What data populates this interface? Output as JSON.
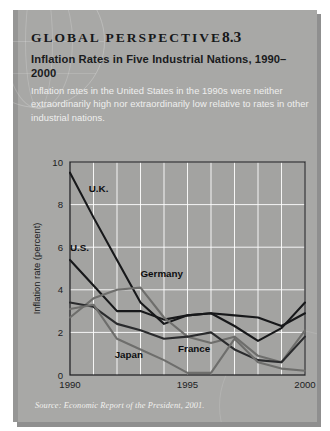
{
  "panel": {
    "kicker_text": "GLOBAL PERSPECTIVE",
    "kicker_number": "8.3",
    "headline": "Inflation Rates in Five Industrial Nations, 1990–2000",
    "lede": "Inflation rates in the United States in the 1990s were neither extraordinarily high nor extraordinarily low relative to rates in other industrial nations.",
    "source": "Source: Economic Report of the President, 2001.",
    "background_color": "#a8a8a6",
    "page_color": "#ffffff"
  },
  "chart_data": {
    "type": "line",
    "xlabel": "",
    "ylabel": "Inflation rate (percent)",
    "x": [
      1990,
      1991,
      1992,
      1993,
      1994,
      1995,
      1996,
      1997,
      1998,
      1999,
      2000
    ],
    "xlim": [
      1990,
      2000
    ],
    "ylim": [
      0,
      10
    ],
    "xticks": [
      1990,
      1995,
      2000
    ],
    "xticklabels": [
      "1990",
      "1995",
      "2000"
    ],
    "yticks": [
      0,
      2,
      4,
      6,
      8,
      10
    ],
    "yticklabels": [
      "0",
      "2",
      "4",
      "6",
      "8",
      "10"
    ],
    "grid": true,
    "grid_color": "#ffffff",
    "legend": "inline-labels",
    "series": [
      {
        "name": "U.K.",
        "color": "#17181a",
        "values": [
          9.5,
          7.4,
          5.4,
          3.4,
          2.4,
          2.8,
          2.9,
          2.8,
          2.7,
          2.3,
          2.9
        ]
      },
      {
        "name": "U.S.",
        "color": "#17181a",
        "values": [
          5.4,
          4.2,
          3.0,
          3.0,
          2.6,
          2.8,
          2.9,
          2.3,
          1.6,
          2.2,
          3.4
        ]
      },
      {
        "name": "Germany",
        "color": "#6e6e6c",
        "values": [
          2.7,
          3.6,
          4.0,
          4.1,
          2.7,
          1.8,
          1.5,
          1.8,
          0.9,
          0.6,
          2.1
        ]
      },
      {
        "name": "France",
        "color": "#2a2b2d",
        "values": [
          3.4,
          3.2,
          2.4,
          2.1,
          1.7,
          1.8,
          2.0,
          1.2,
          0.7,
          0.6,
          1.8
        ]
      },
      {
        "name": "Japan",
        "color": "#6e6e6c",
        "values": [
          3.1,
          3.3,
          1.7,
          1.2,
          0.7,
          0.1,
          0.1,
          1.7,
          0.6,
          0.3,
          0.2
        ]
      }
    ],
    "series_labels": [
      {
        "text": "U.K.",
        "x": 1990.8,
        "y": 8.6
      },
      {
        "text": "U.S.",
        "x": 1990.0,
        "y": 5.8
      },
      {
        "text": "Germany",
        "x": 1993.0,
        "y": 4.6
      },
      {
        "text": "France",
        "x": 1994.6,
        "y": 1.1
      },
      {
        "text": "Japan",
        "x": 1991.9,
        "y": 0.8
      }
    ]
  }
}
